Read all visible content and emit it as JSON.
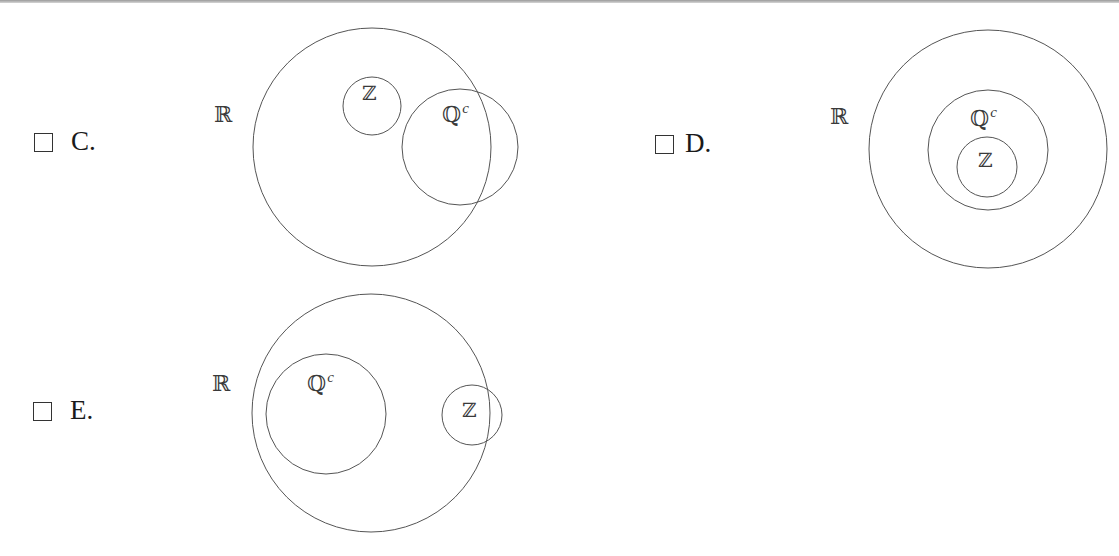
{
  "options": [
    {
      "id": "C",
      "label": "C.",
      "checked": false,
      "universe_label": "ℝ",
      "sets": [
        {
          "name": "Z",
          "label": "ℤ",
          "superscript": ""
        },
        {
          "name": "Qc",
          "label": "ℚ",
          "superscript": "c"
        }
      ],
      "relationship": "ℤ inside ℝ; ℚᶜ partially overlaps ℝ boundary; ℤ and ℚᶜ disjoint"
    },
    {
      "id": "D",
      "label": "D.",
      "checked": false,
      "universe_label": "ℝ",
      "sets": [
        {
          "name": "Qc",
          "label": "ℚ",
          "superscript": "c"
        },
        {
          "name": "Z",
          "label": "ℤ",
          "superscript": ""
        }
      ],
      "relationship": "ℤ ⊂ ℚᶜ ⊂ ℝ (concentric)"
    },
    {
      "id": "E",
      "label": "E.",
      "checked": false,
      "universe_label": "ℝ",
      "sets": [
        {
          "name": "Qc",
          "label": "ℚ",
          "superscript": "c"
        },
        {
          "name": "Z",
          "label": "ℤ",
          "superscript": ""
        }
      ],
      "relationship": "ℚᶜ inside ℝ; ℤ partially overlaps ℝ boundary; ℤ and ℚᶜ disjoint"
    }
  ],
  "style": {
    "stroke_color": "#555555",
    "text_color": "#1a1a1a",
    "background": "#ffffff"
  }
}
